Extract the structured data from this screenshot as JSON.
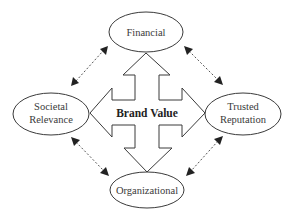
{
  "diagram": {
    "title": "Brand Value",
    "center_label": "Brand Value",
    "nodes": [
      {
        "id": "financial",
        "label_lines": [
          "Financial"
        ]
      },
      {
        "id": "societal-relevance",
        "label_lines": [
          "Societal",
          "Relevance"
        ]
      },
      {
        "id": "trusted-reputation",
        "label_lines": [
          "Trusted",
          "Reputation"
        ]
      },
      {
        "id": "organizational",
        "label_lines": [
          "Organizational"
        ]
      }
    ],
    "edges": [
      {
        "from": "brand-value",
        "to": "financial",
        "style": "solid-block-arrow"
      },
      {
        "from": "brand-value",
        "to": "societal-relevance",
        "style": "solid-block-arrow"
      },
      {
        "from": "brand-value",
        "to": "trusted-reputation",
        "style": "solid-block-arrow"
      },
      {
        "from": "brand-value",
        "to": "organizational",
        "style": "solid-block-arrow"
      },
      {
        "from": "financial",
        "to": "societal-relevance",
        "style": "dashed-bidirectional"
      },
      {
        "from": "financial",
        "to": "trusted-reputation",
        "style": "dashed-bidirectional"
      },
      {
        "from": "societal-relevance",
        "to": "organizational",
        "style": "dashed-bidirectional"
      },
      {
        "from": "trusted-reputation",
        "to": "organizational",
        "style": "dashed-bidirectional"
      }
    ],
    "colors": {
      "stroke": "#3a3a3a",
      "text": "#3a3a3a",
      "background": "#ffffff"
    }
  }
}
